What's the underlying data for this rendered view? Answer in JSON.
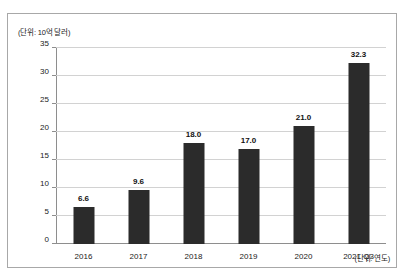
{
  "figure": {
    "unit_y_label": "(단위: 10억 달러)",
    "unit_x_label": "(단위: 연도)"
  },
  "chart_data": {
    "type": "bar",
    "title": "",
    "subtitle": "",
    "xlabel": "(단위: 연도)",
    "ylabel": "(단위: 10억 달러)",
    "categories": [
      "2016",
      "2017",
      "2018",
      "2019",
      "2020",
      "2021 Q3"
    ],
    "values": [
      6.6,
      9.6,
      18.0,
      17.0,
      21.0,
      32.3
    ],
    "data_labels": [
      "6.6",
      "9.6",
      "18.0",
      "17.0",
      "21.0",
      "32.3"
    ],
    "ylim": [
      0,
      35
    ],
    "ytick_labels": [
      "0",
      "5",
      "10",
      "15",
      "20",
      "25",
      "30",
      "35"
    ],
    "ytick_values": [
      0,
      5,
      10,
      15,
      20,
      25,
      30,
      35
    ],
    "grid": true,
    "legend": "none",
    "series": [
      {
        "name": "",
        "values": [
          6.6,
          9.6,
          18.0,
          17.0,
          21.0,
          32.3
        ],
        "color": "#2b2b2b"
      }
    ]
  },
  "colors": {
    "bar": "#2b2b2b",
    "grid": "#d2d2d2",
    "axis": "#8e8e8e",
    "border": "#a8a8a8",
    "text": "#1a1a1a"
  }
}
